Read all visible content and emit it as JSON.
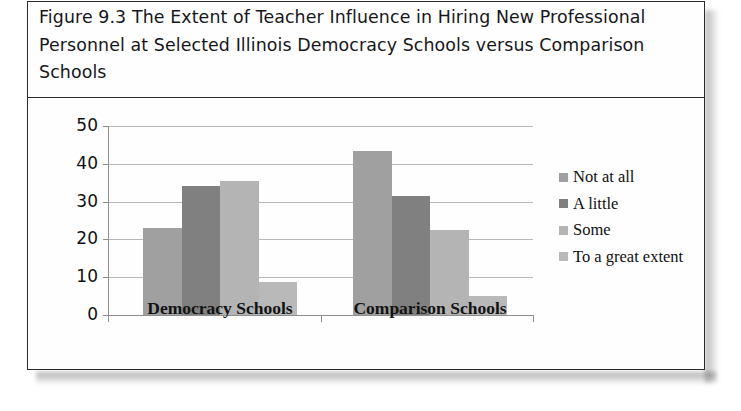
{
  "figure": {
    "caption": "Figure 9.3 The Extent of Teacher Influence in Hiring New Professional Personnel at Selected Illinois Democracy Schools versus Comparison Schools"
  },
  "chart_data": {
    "type": "bar",
    "title": "Figure 9.3 The Extent of Teacher Influence in Hiring New Professional Personnel at Selected Illinois Democracy Schools versus Comparison Schools",
    "xlabel": "",
    "ylabel": "",
    "categories": [
      "Democracy Schools",
      "Comparison Schools"
    ],
    "series": [
      {
        "name": "Not at all",
        "color": "#a0a0a0",
        "values": [
          23.0,
          43.5
        ]
      },
      {
        "name": "A little",
        "color": "#808080",
        "values": [
          34.0,
          31.5
        ]
      },
      {
        "name": "Some",
        "color": "#b4b4b4",
        "values": [
          35.5,
          22.5
        ]
      },
      {
        "name": "To a great extent",
        "color": "#b9b9b9",
        "values": [
          8.7,
          5.0
        ]
      }
    ],
    "ylim": [
      0,
      50
    ],
    "yticks": [
      0,
      10,
      20,
      30,
      40,
      50
    ],
    "ytick_labels": [
      "0",
      "10",
      "20",
      "30",
      "40",
      "50"
    ],
    "grid": true,
    "legend_position": "right"
  },
  "legend": {
    "items": [
      {
        "label": "Not at all"
      },
      {
        "label": "A little"
      },
      {
        "label": "Some"
      },
      {
        "label": "To a great extent"
      }
    ]
  },
  "axis": {
    "y_labels": [
      "50",
      "40",
      "30",
      "20",
      "10",
      "0"
    ],
    "x_labels": [
      "Democracy Schools",
      "Comparison Schools"
    ]
  }
}
